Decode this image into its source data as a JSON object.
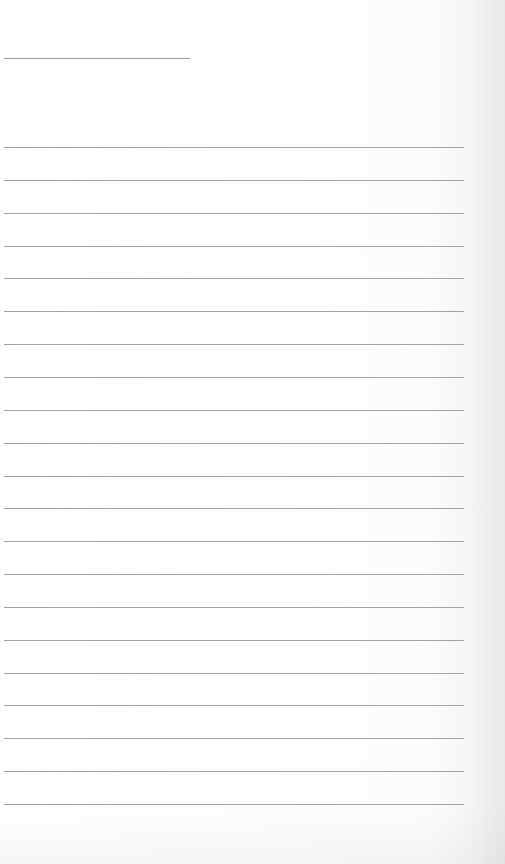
{
  "page": {
    "type": "lined-paper",
    "background_color": "#fdfdfd",
    "line_color": "#a3a3a3",
    "header_line": {
      "x": 4,
      "y": 58,
      "width": 186
    },
    "rules": {
      "count": 21,
      "first_y": 147,
      "spacing": 32.85,
      "x": 4,
      "width": 460
    },
    "text": []
  }
}
